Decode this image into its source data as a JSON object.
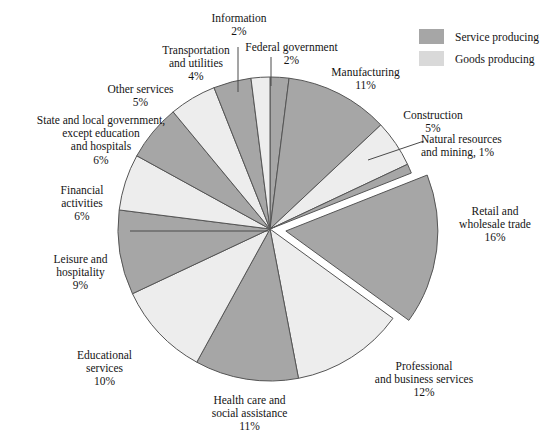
{
  "chart_data": {
    "type": "pie",
    "title": "",
    "legend_position": "top-right",
    "start_angle_deg": 0,
    "direction": "clockwise",
    "exploded_slice": "Retail and wholesale trade",
    "colors": {
      "service_producing": "#a6a6a6",
      "goods_producing": "#ededed",
      "outline": "#555555",
      "background": "#ffffff"
    },
    "categories": [
      "Federal government",
      "Manufacturing",
      "Construction",
      "Natural resources and mining",
      "Retail and wholesale trade",
      "Professional and business services",
      "Health care and social assistance",
      "Educational services",
      "Leisure and hospitality",
      "Financial activities",
      "State and local government, except education and hospitals",
      "Other services",
      "Transportation and utilities",
      "Information"
    ],
    "values": [
      2,
      11,
      5,
      1,
      16,
      12,
      11,
      10,
      9,
      6,
      6,
      5,
      4,
      2
    ],
    "units": "percent",
    "slices": [
      {
        "label": "Federal government",
        "value": 2,
        "pct_text": "2%",
        "group": "service producing",
        "color": "#a6a6a6"
      },
      {
        "label": "Manufacturing",
        "value": 11,
        "pct_text": "11%",
        "group": "goods producing",
        "color": "#a6a6a6"
      },
      {
        "label": "Construction",
        "value": 5,
        "pct_text": "5%",
        "group": "goods producing",
        "color": "#ededed"
      },
      {
        "label": "Natural resources and mining",
        "value": 1,
        "pct_text": "1%",
        "group": "goods producing",
        "color": "#a6a6a6"
      },
      {
        "label": "Retail and wholesale trade",
        "value": 16,
        "pct_text": "16%",
        "group": "service producing",
        "color": "#a6a6a6"
      },
      {
        "label": "Professional and business services",
        "value": 12,
        "pct_text": "12%",
        "group": "service producing",
        "color": "#ededed"
      },
      {
        "label": "Health care and social assistance",
        "value": 11,
        "pct_text": "11%",
        "group": "service producing",
        "color": "#a6a6a6"
      },
      {
        "label": "Educational services",
        "value": 10,
        "pct_text": "10%",
        "group": "service producing",
        "color": "#ededed"
      },
      {
        "label": "Leisure and hospitality",
        "value": 9,
        "pct_text": "9%",
        "group": "service producing",
        "color": "#a6a6a6"
      },
      {
        "label": "Financial activities",
        "value": 6,
        "pct_text": "6%",
        "group": "service producing",
        "color": "#ededed"
      },
      {
        "label": "State and local government, except education and hospitals",
        "value": 6,
        "pct_text": "6%",
        "group": "service producing",
        "color": "#a6a6a6"
      },
      {
        "label": "Other services",
        "value": 5,
        "pct_text": "5%",
        "group": "service producing",
        "color": "#ededed"
      },
      {
        "label": "Transportation and utilities",
        "value": 4,
        "pct_text": "4%",
        "group": "service producing",
        "color": "#a6a6a6"
      },
      {
        "label": "Information",
        "value": 2,
        "pct_text": "2%",
        "group": "service producing",
        "color": "#ededed"
      }
    ]
  },
  "legend": {
    "items": [
      {
        "label": "Service producing",
        "color": "#a6a6a6"
      },
      {
        "label": "Goods producing",
        "color": "#d9d9d9"
      }
    ]
  },
  "labels": {
    "information": {
      "name": "Information",
      "pct": "2%"
    },
    "federal_government": {
      "name": "Federal government",
      "pct": "2%"
    },
    "transportation": {
      "line1": "Transportation",
      "line2": "and utilities",
      "pct": "4%"
    },
    "manufacturing": {
      "name": "Manufacturing",
      "pct": "11%"
    },
    "construction": {
      "name": "Construction",
      "pct": "5%"
    },
    "natural_resources": {
      "line1": "Natural resources",
      "line2": "and mining, 1%"
    },
    "other_services": {
      "name": "Other services",
      "pct": "5%"
    },
    "state_local": {
      "line1": "State and local government,",
      "line2": "except education",
      "line3": "and hospitals",
      "pct": "6%"
    },
    "financial": {
      "line1": "Financial",
      "line2": "activities",
      "pct": "6%"
    },
    "leisure": {
      "line1": "Leisure and",
      "line2": "hospitality",
      "pct": "9%"
    },
    "educational": {
      "line1": "Educational",
      "line2": "services",
      "pct": "10%"
    },
    "health_care": {
      "line1": "Health care and",
      "line2": "social assistance",
      "pct": "11%"
    },
    "professional": {
      "line1": "Professional",
      "line2": "and business services",
      "pct": "12%"
    },
    "retail": {
      "line1": "Retail and",
      "line2": "wholesale trade",
      "pct": "16%"
    }
  }
}
